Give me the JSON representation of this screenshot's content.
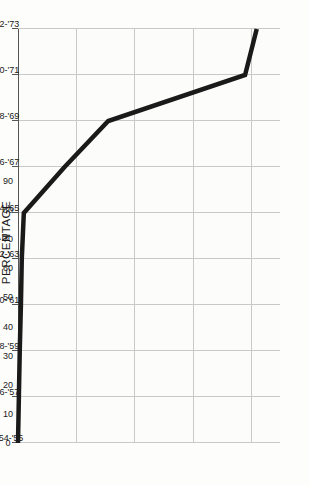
{
  "chart": {
    "title": "PERCENTAGE",
    "category_axis_title": "SCHOOL YEAR"
  },
  "chart_data": {
    "type": "line",
    "title": "PERCENTAGE",
    "xlabel": "SCHOOL YEAR",
    "ylabel": "PERCENTAGE",
    "orientation": "rotated-90-ccw",
    "grid": true,
    "legend": null,
    "value_axis": {
      "label": "PERCENTAGE",
      "ticks": [
        0,
        10,
        20,
        30,
        40,
        50,
        60,
        70,
        80,
        90
      ],
      "tick_labels": [
        "0",
        "10",
        "20",
        "30",
        "40",
        "50",
        "60",
        "70",
        "80",
        "90"
      ],
      "range": [
        0,
        90
      ]
    },
    "categories": [
      "1954-'55",
      "'56-'57",
      "'58-'59",
      "'60-'61",
      "'62-'63",
      "'64-'65",
      "'66-'67",
      "'68-'69",
      "'70-'71",
      "'72-'73"
    ],
    "values": [
      0,
      0.3,
      0.6,
      1,
      1.3,
      2,
      16,
      31,
      78,
      82
    ],
    "series": [
      {
        "name": "percentage",
        "color": "#1a1a1a",
        "values": [
          0,
          0.3,
          0.6,
          1,
          1.3,
          2,
          16,
          31,
          78,
          82
        ]
      }
    ]
  },
  "style": {
    "line_color": "#1a1a1a",
    "grid_color": "#c9c9c9",
    "axis_color": "#555555",
    "background": "#fdfdfc"
  }
}
